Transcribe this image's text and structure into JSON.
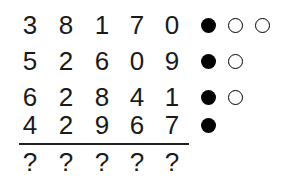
{
  "puzzle": {
    "rows": [
      {
        "digits": [
          "3",
          "8",
          "1",
          "7",
          "0"
        ],
        "clues": [
          "filled",
          "empty",
          "empty"
        ]
      },
      {
        "digits": [
          "5",
          "2",
          "6",
          "0",
          "9"
        ],
        "clues": [
          "filled",
          "empty"
        ]
      },
      {
        "digits": [
          "6",
          "2",
          "8",
          "4",
          "1"
        ],
        "clues": [
          "filled",
          "empty"
        ]
      },
      {
        "digits": [
          "4",
          "2",
          "9",
          "6",
          "7"
        ],
        "clues": [
          "filled"
        ]
      }
    ],
    "answer": [
      "?",
      "?",
      "?",
      "?",
      "?"
    ],
    "colors": {
      "ink": "#000000",
      "background": "#ffffff"
    }
  }
}
